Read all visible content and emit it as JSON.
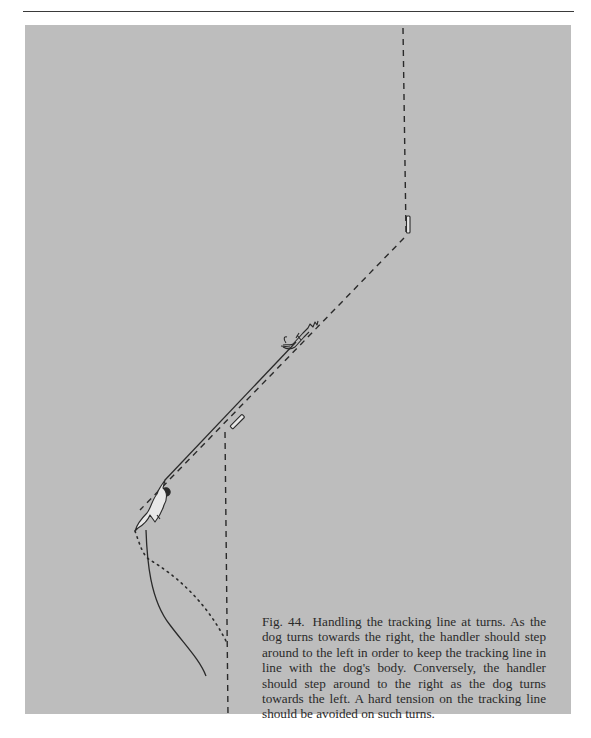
{
  "page": {
    "background": "#ffffff",
    "rule_color": "#3a3a3a",
    "panel_color": "#bdbdbd",
    "ink_color": "#2a2a2a"
  },
  "figure": {
    "label": "Fig. 44.",
    "caption": "Handling the tracking line at turns. As the dog turns towards the right, the handler should step around to the left in order to keep the tracking line in line with the dog's body. Conversely, the handler should step around to the right as the dog turns towards the left. A hard tension on the tracking line should be avoided on such turns.",
    "elements": {
      "track_upper_dashed": "dashed track (vertical, top right)",
      "turn_marker_upper": "track marker stake at upper turn",
      "track_diagonal_dashed": "dashed diagonal track",
      "dog": "tracking dog",
      "tracking_line": "tracking line (solid)",
      "handler": "handler",
      "turn_marker_lower": "track marker stake at lower turn",
      "track_lower_dashed": "dashed track (vertical, bottom)",
      "handler_path_solid": "handler's path (solid curve)",
      "handler_path_dotted": "alternative handler path (dotted)"
    }
  }
}
